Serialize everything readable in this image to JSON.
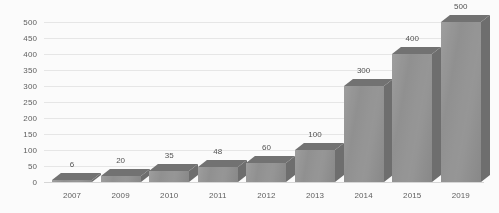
{
  "chart_data": {
    "type": "bar",
    "title": "",
    "subtitle": "",
    "xlabel": "",
    "ylabel": "",
    "categories": [
      "2007",
      "2009",
      "2010",
      "2011",
      "2012",
      "2013",
      "2014",
      "2015",
      "2019"
    ],
    "values": [
      6,
      20,
      35,
      48,
      60,
      100,
      300,
      400,
      500
    ],
    "data_labels": [
      "6",
      "20",
      "35",
      "48",
      "60",
      "100",
      "300",
      "400",
      "500"
    ],
    "ylim": [
      0,
      500
    ],
    "ytick_values": [
      0,
      50,
      100,
      150,
      200,
      250,
      300,
      350,
      400,
      450,
      500
    ],
    "ytick_labels": [
      "0",
      "50",
      "100",
      "150",
      "200",
      "250",
      "300",
      "350",
      "400",
      "450",
      "500"
    ],
    "grid": true,
    "legend": false,
    "legend_position": "none",
    "style": "3d-column",
    "colors": {
      "bar_front": "#909090",
      "bar_top": "#6f6f6f",
      "bar_side": "#6a6a6a",
      "gridline": "#e9e9e9",
      "baseline": "#d8d8d8",
      "text": "#5a5a5a",
      "background": "#ffffff"
    }
  }
}
